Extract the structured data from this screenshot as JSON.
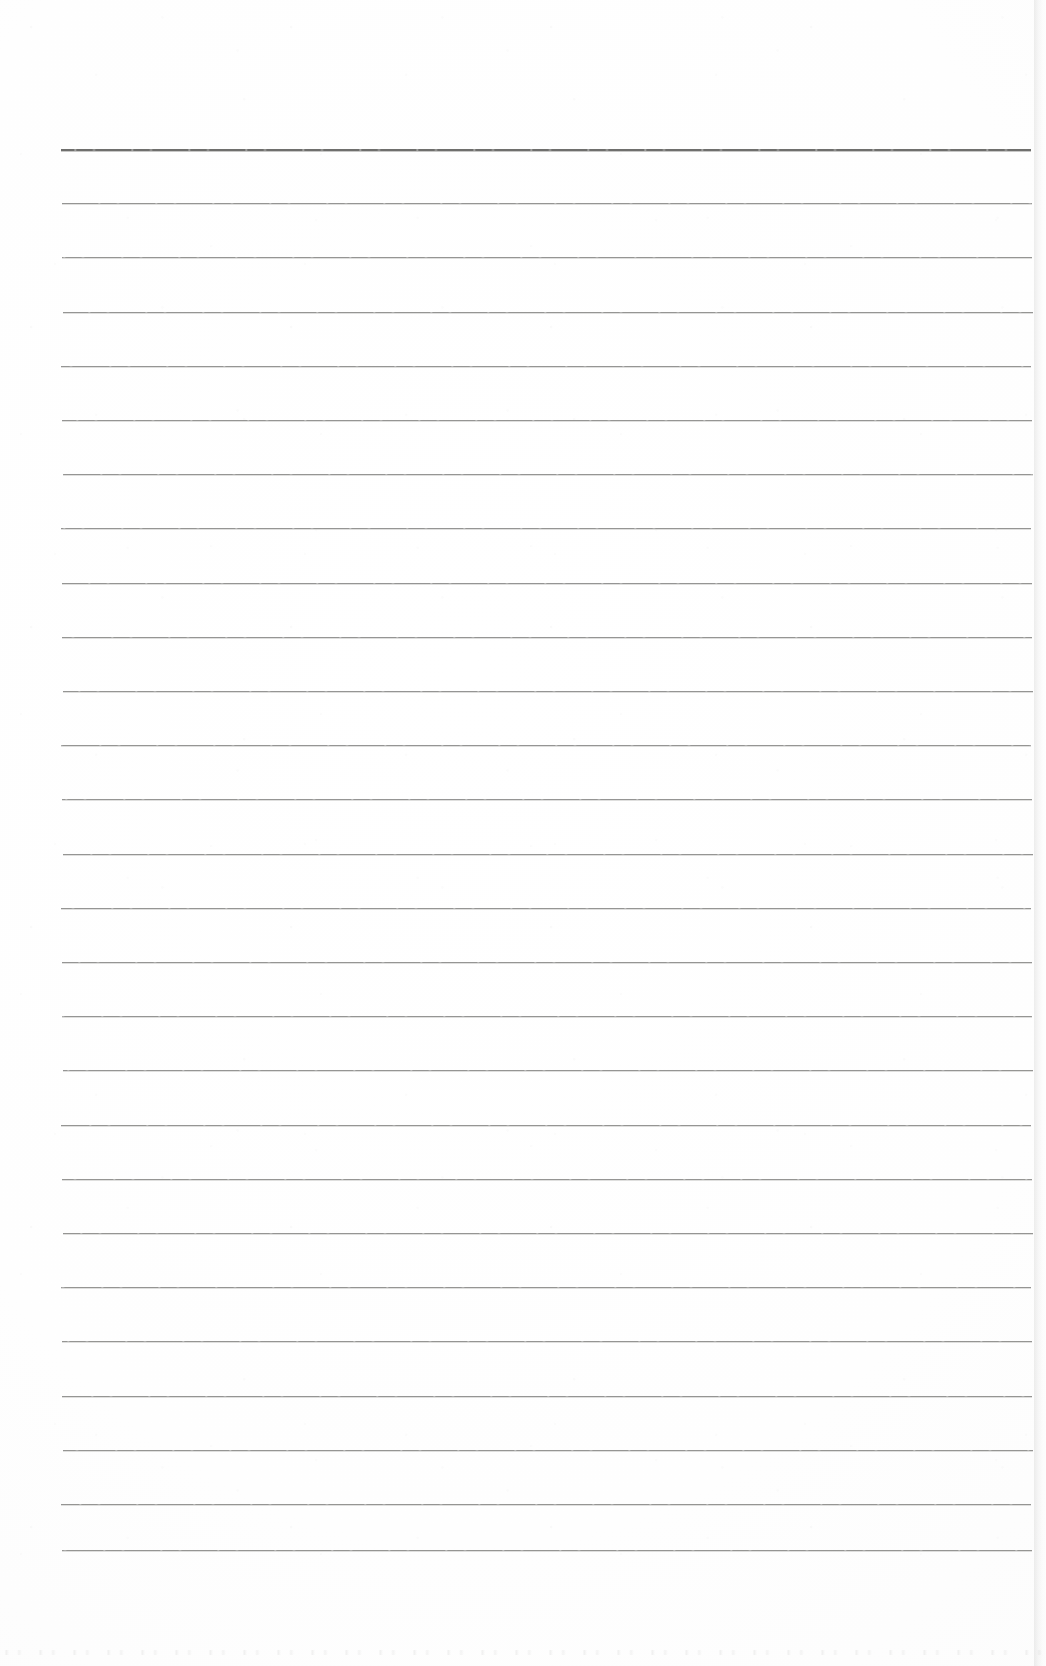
{
  "document": {
    "kind": "scanned-lined-paper",
    "description": "Blank scanned ruled notebook page",
    "page_width": 1046,
    "page_height": 1666,
    "background_color": "#fdfdfd",
    "text_content": "",
    "handwriting_present": false,
    "printed_text_present": false
  },
  "ruling": {
    "line_color": "#8d8d8b",
    "header_line_color": "#6f6f6d",
    "line_count": 27,
    "line_left_x": 62,
    "line_right_x": 1032,
    "line_length": 970,
    "first_line_y": 149,
    "last_line_y": 1550,
    "line_spacing": 54.2,
    "header_line_index": 0,
    "header_line_thickness": 2,
    "body_line_thickness": 1,
    "lines_y": [
      149,
      203.2,
      257.4,
      311.6,
      365.8,
      420,
      474.2,
      528.4,
      582.6,
      636.8,
      691,
      745.2,
      799.4,
      853.6,
      907.8,
      962,
      1016.2,
      1070.4,
      1124.6,
      1178.8,
      1233,
      1287.2,
      1341.4,
      1395.6,
      1449.8,
      1504,
      1550
    ]
  },
  "margins": {
    "top_blank_height": 149,
    "bottom_blank_height": 116,
    "left_blank_width": 62,
    "right_blank_width": 14,
    "vertical_margin_rule_present": false
  },
  "artifacts": {
    "right_edge_shadow": true,
    "right_edge_x": 1034,
    "bottom_speckle_band": true,
    "bottom_speckle_y": 1636,
    "scan_noise": true
  }
}
